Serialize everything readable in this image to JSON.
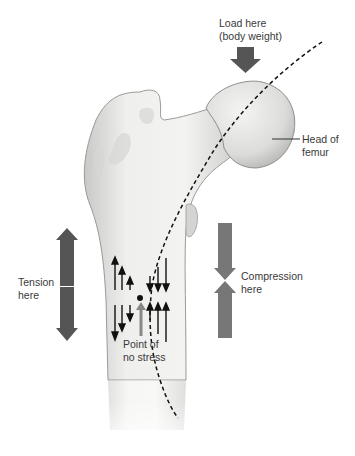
{
  "diagram": {
    "labels": {
      "load": [
        "Load here",
        "(body weight)"
      ],
      "head": [
        "Head of",
        "femur"
      ],
      "tension": [
        "Tension",
        "here"
      ],
      "compression": [
        "Compression",
        "here"
      ],
      "neutral": [
        "Point of",
        "no stress"
      ]
    },
    "colors": {
      "arrow_dark": "#555555",
      "arrow_gray": "#777777",
      "bone": "#e8e8e6",
      "bone_shadow": "#bdbdbb",
      "text": "#3a3a3a"
    },
    "icons": [
      "down-arrow-icon",
      "double-headed-arrow-icon",
      "converging-arrows-icon",
      "small-up-arrow-icon",
      "small-down-arrow-icon",
      "dashed-neutral-axis-line"
    ]
  }
}
